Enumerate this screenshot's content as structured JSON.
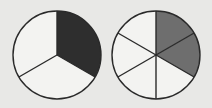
{
  "diagram": {
    "type": "fraction-circles",
    "background": "#e8e8e6",
    "stroke_color": "#2a2a2a",
    "empty_fill": "#f3f3f1",
    "circles": [
      {
        "name": "thirds-circle",
        "center": [
          57,
          55
        ],
        "radius": 44,
        "slices": 3,
        "shaded": 1,
        "shade_color": "#2e2e2e",
        "fraction": "1/3"
      },
      {
        "name": "sixths-circle",
        "center": [
          156,
          55
        ],
        "radius": 44,
        "slices": 6,
        "shaded": 2,
        "shade_color": "#6e6e6e",
        "fraction": "2/6"
      }
    ]
  }
}
